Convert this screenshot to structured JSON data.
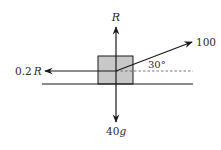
{
  "diagram": {
    "type": "free-body force diagram",
    "colors": {
      "line": "#1a1a1a",
      "block_fill": "#c8c8c8",
      "block_stroke": "#1a1a1a",
      "dashed": "#555555",
      "background": "#ffffff"
    },
    "labels": {
      "normal_force": "R",
      "friction_force": "0.2",
      "friction_force_symbol": "R",
      "applied_force": "100",
      "angle": "30°",
      "weight": "40",
      "weight_symbol": "g"
    },
    "forces": [
      {
        "name": "normal reaction",
        "label": "R",
        "direction": "up"
      },
      {
        "name": "friction",
        "label": "0.2R",
        "direction": "left"
      },
      {
        "name": "applied pull",
        "label": "100",
        "direction": "up-right",
        "angle_deg": 30
      },
      {
        "name": "weight",
        "label": "40g",
        "direction": "down"
      }
    ]
  }
}
